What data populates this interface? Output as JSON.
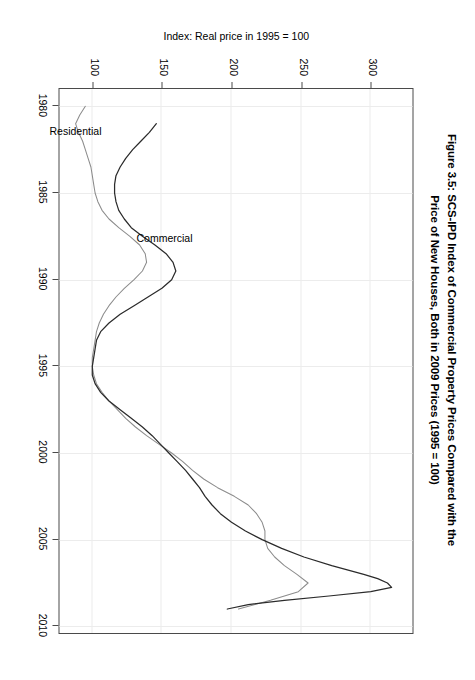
{
  "figure": {
    "title_line1": "Figure 3.5: SCS-IPD Index of Commercial Property Prices Compared with the",
    "title_line2": "Price of New Houses, Both in 2009 Prices (1995 = 100)",
    "orientation": "rotated-90-clockwise"
  },
  "chart_data": {
    "type": "line",
    "title": "Figure 3.5: SCS-IPD Index of Commercial Property Prices Compared with the Price of New Houses, Both in 2009 Prices (1995 = 100)",
    "xlabel": "",
    "ylabel": "Index: Real price in 1995 = 100",
    "xlim": [
      1979,
      2010.5
    ],
    "ylim": [
      75,
      330
    ],
    "xticks": [
      1980,
      1985,
      1990,
      1995,
      2000,
      2005,
      2010
    ],
    "xticklabels": [
      "1980",
      "1985",
      "1990",
      "1995",
      "2000",
      "2005",
      "2010"
    ],
    "yticks": [
      100,
      150,
      200,
      250,
      300
    ],
    "yticklabels": [
      "100",
      "150",
      "200",
      "250",
      "300"
    ],
    "grid": true,
    "legend": "inline-labels",
    "annotations": [
      {
        "text": "Commercial",
        "x": 1987.6,
        "y": 152,
        "rotation": -90
      },
      {
        "text": "Residential",
        "x": 1981.4,
        "y": 88,
        "rotation": -90
      }
    ],
    "series": [
      {
        "name": "Commercial",
        "color": "#2b2b2b",
        "x": [
          1981.0,
          1981.5,
          1982.0,
          1982.5,
          1983.0,
          1983.5,
          1984.0,
          1984.5,
          1985.0,
          1985.5,
          1986.0,
          1986.5,
          1987.0,
          1987.5,
          1988.0,
          1988.5,
          1989.0,
          1989.5,
          1990.0,
          1990.5,
          1991.0,
          1991.5,
          1992.0,
          1992.5,
          1993.0,
          1993.5,
          1994.0,
          1994.5,
          1995.0,
          1995.5,
          1996.0,
          1996.5,
          1997.0,
          1997.5,
          1998.0,
          1998.5,
          1999.0,
          1999.5,
          2000.0,
          2000.5,
          2001.0,
          2001.5,
          2002.0,
          2002.5,
          2003.0,
          2003.5,
          2004.0,
          2004.5,
          2005.0,
          2005.5,
          2006.0,
          2006.5,
          2007.0,
          2007.25,
          2007.5,
          2007.75,
          2008.0,
          2008.25,
          2008.5,
          2008.75,
          2009.0
        ],
        "y": [
          146,
          141,
          135,
          129,
          124,
          120,
          117,
          116,
          116,
          117,
          119,
          123,
          128,
          136,
          145,
          153,
          158,
          160,
          157,
          150,
          140,
          130,
          120,
          112,
          106,
          103,
          102,
          101,
          100,
          100,
          102,
          106,
          112,
          120,
          128,
          136,
          143,
          149,
          155,
          161,
          167,
          172,
          177,
          181,
          186,
          192,
          200,
          210,
          222,
          236,
          252,
          272,
          295,
          305,
          312,
          315,
          300,
          270,
          238,
          212,
          197
        ]
      },
      {
        "name": "Residential",
        "color": "#8c8c8c",
        "x": [
          1980.0,
          1980.5,
          1981.0,
          1981.5,
          1982.0,
          1982.5,
          1983.0,
          1983.5,
          1984.0,
          1984.5,
          1985.0,
          1985.5,
          1986.0,
          1986.5,
          1987.0,
          1987.5,
          1988.0,
          1988.5,
          1989.0,
          1989.5,
          1990.0,
          1990.5,
          1991.0,
          1991.5,
          1992.0,
          1992.5,
          1993.0,
          1993.5,
          1994.0,
          1994.5,
          1995.0,
          1995.5,
          1996.0,
          1996.5,
          1997.0,
          1997.5,
          1998.0,
          1998.5,
          1999.0,
          1999.5,
          2000.0,
          2000.5,
          2001.0,
          2001.5,
          2002.0,
          2002.5,
          2003.0,
          2003.5,
          2004.0,
          2004.5,
          2005.0,
          2005.5,
          2006.0,
          2006.5,
          2007.0,
          2007.5,
          2008.0,
          2008.5,
          2009.0
        ],
        "y": [
          95,
          91,
          88,
          90,
          93,
          95,
          97,
          99,
          100,
          101,
          102,
          104,
          107,
          112,
          119,
          127,
          134,
          138,
          139,
          136,
          130,
          123,
          117,
          112,
          108,
          105,
          103,
          102,
          101,
          100,
          100,
          101,
          103,
          107,
          112,
          118,
          124,
          131,
          139,
          148,
          157,
          165,
          172,
          180,
          190,
          202,
          212,
          218,
          222,
          224,
          224,
          226,
          231,
          238,
          247,
          255,
          248,
          228,
          205
        ]
      }
    ]
  },
  "axes": {
    "x_tick_labels": [
      "1980",
      "1985",
      "1990",
      "1995",
      "2000",
      "2005",
      "2010"
    ],
    "y_tick_labels": [
      "100",
      "150",
      "200",
      "250",
      "300"
    ],
    "y_axis_title": "Index: Real price in 1995 = 100"
  },
  "series_labels": {
    "commercial": "Commercial",
    "residential": "Residential"
  }
}
